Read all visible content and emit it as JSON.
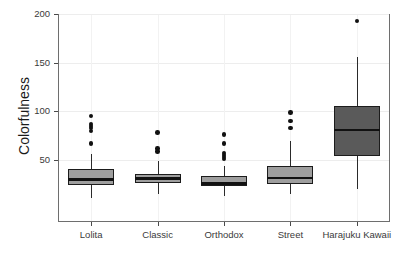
{
  "chart_data": {
    "type": "box",
    "title": "",
    "xlabel": "",
    "ylabel": "Colorfulness",
    "ylim": [
      0,
      200
    ],
    "yticks": [
      50,
      100,
      150,
      200
    ],
    "ytick_labels": [
      "50",
      "100",
      "150",
      "200"
    ],
    "grid": true,
    "legend": "none",
    "categories": [
      "Lolita",
      "Classic",
      "Orthodox",
      "Street",
      "Harajuku Kawaii"
    ],
    "boxes": [
      {
        "name": "Lolita",
        "fill": "#9e9e9e",
        "lower_whisker": 11,
        "q1": 24,
        "median": 30,
        "q3": 41,
        "upper_whisker": 56,
        "outliers": [
          95,
          87,
          85,
          83,
          80,
          67
        ]
      },
      {
        "name": "Classic",
        "fill": "#9e9e9e",
        "lower_whisker": 15,
        "q1": 26,
        "median": 31,
        "q3": 36,
        "upper_whisker": 49,
        "outliers": [
          78,
          62,
          59
        ]
      },
      {
        "name": "Orthodox",
        "fill": "#9e9e9e",
        "lower_whisker": 13,
        "q1": 23,
        "median": 26,
        "q3": 34,
        "upper_whisker": 44,
        "outliers": [
          76,
          67,
          57,
          55,
          53,
          51
        ]
      },
      {
        "name": "Street",
        "fill": "#9e9e9e",
        "lower_whisker": 15,
        "q1": 25,
        "median": 32,
        "q3": 44,
        "upper_whisker": 70,
        "outliers": [
          99,
          90,
          83
        ]
      },
      {
        "name": "Harajuku Kawaii",
        "fill": "#5a5a5a",
        "lower_whisker": 20,
        "q1": 54,
        "median": 81,
        "q3": 105,
        "upper_whisker": 156,
        "outliers": [
          193
        ]
      }
    ],
    "colors": {
      "box_light": "#9e9e9e",
      "box_dark": "#5a5a5a",
      "line": "#111111",
      "frame": "#6e6e6e",
      "grid": "#ededed",
      "text": "#3a3a3a"
    }
  }
}
